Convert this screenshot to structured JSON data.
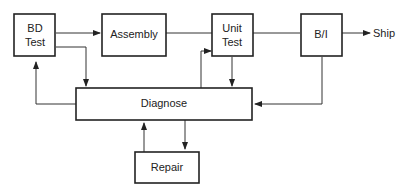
{
  "diagram": {
    "nodes": {
      "bd_test": {
        "line1": "BD",
        "line2": "Test"
      },
      "assembly": {
        "label": "Assembly"
      },
      "unit_test": {
        "line1": "Unit",
        "line2": "Test"
      },
      "bi": {
        "label": "B/I"
      },
      "diagnose": {
        "label": "Diagnose"
      },
      "repair": {
        "label": "Repair"
      },
      "ship": {
        "label": "Ship"
      }
    },
    "edges": [
      {
        "from": "BD Test",
        "to": "Assembly"
      },
      {
        "from": "Assembly",
        "to": "Unit Test"
      },
      {
        "from": "Unit Test",
        "to": "B/I"
      },
      {
        "from": "B/I",
        "to": "Ship"
      },
      {
        "from": "BD Test",
        "to": "Diagnose"
      },
      {
        "from": "Diagnose",
        "to": "BD Test"
      },
      {
        "from": "Unit Test",
        "to": "Diagnose"
      },
      {
        "from": "Diagnose",
        "to": "Unit Test"
      },
      {
        "from": "B/I",
        "to": "Diagnose"
      },
      {
        "from": "Diagnose",
        "to": "Repair"
      },
      {
        "from": "Repair",
        "to": "Diagnose"
      }
    ]
  }
}
